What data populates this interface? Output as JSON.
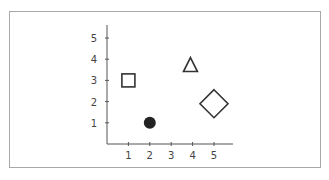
{
  "chart_data": {
    "type": "scatter",
    "title": "",
    "xlabel": "",
    "ylabel": "",
    "xlim": [
      0,
      6
    ],
    "ylim": [
      0,
      5.6
    ],
    "grid": false,
    "legend": null,
    "x_ticks": [
      "1",
      "2",
      "3",
      "4",
      "5"
    ],
    "y_ticks": [
      "1",
      "2",
      "3",
      "4",
      "5"
    ],
    "points": [
      {
        "shape": "square",
        "filled": false,
        "x": 1,
        "y": 3,
        "size": "medium"
      },
      {
        "shape": "circle",
        "filled": true,
        "x": 2,
        "y": 1,
        "size": "small"
      },
      {
        "shape": "triangle",
        "filled": false,
        "x": 3.9,
        "y": 3.7,
        "size": "medium"
      },
      {
        "shape": "diamond",
        "filled": false,
        "x": 5,
        "y": 1.9,
        "size": "large"
      }
    ]
  },
  "colors": {
    "axis": "#555555",
    "marker_stroke": "#333333",
    "marker_fill": "#222222",
    "frame": "#a8a8a8"
  }
}
